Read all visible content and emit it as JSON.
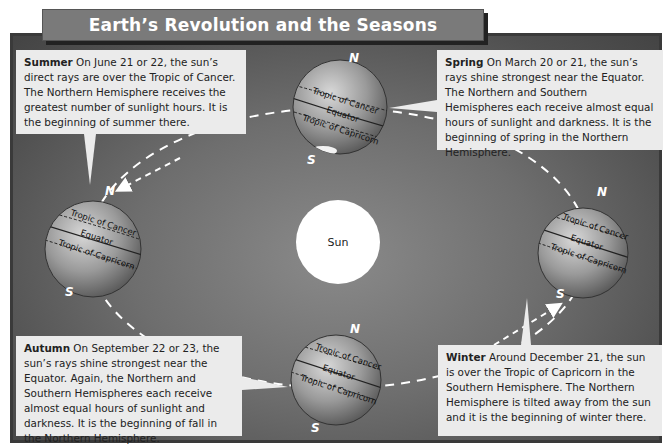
{
  "title": "Earth’s Revolution and the Seasons",
  "sun": {
    "label": "Sun"
  },
  "pole_labels": {
    "north": "N",
    "south": "S"
  },
  "latitude_labels": {
    "cancer": "Tropic of Cancer",
    "equator": "Equator",
    "capricorn": "Tropic of Capricorn"
  },
  "seasons": {
    "summer": {
      "name": "Summer",
      "text": "On June 21 or 22, the sun’s direct rays are over the Tropic of Cancer. The Northern Hemisphere receives the greatest number of sunlight hours. It is the beginning of summer there."
    },
    "spring": {
      "name": "Spring",
      "text": "On March 20 or 21, the sun’s rays shine strongest near the Equator. The Northern and Southern Hemispheres each receive almost equal hours of sunlight and darkness. It is the beginning of spring in the Northern Hemisphere."
    },
    "autumn": {
      "name": "Autumn",
      "text": "On September 22 or 23, the sun’s rays shine strongest near the Equator. Again, the Northern and Southern Hemispheres each receive almost equal hours of sunlight and darkness. It is the beginning of fall in the Northern Hemisphere."
    },
    "winter": {
      "name": "Winter",
      "text": "Around December 21, the sun is over the Tropic of Capricorn in the Southern Hemisphere. The Northern Hemisphere is tilted away from the sun and it is the beginning of winter there."
    }
  },
  "colors": {
    "background": "#6e6e6e",
    "frame": "#3a3a3a",
    "title_bar": "#7a7a7a",
    "callout": "#ebebeb",
    "sun": "#ffffff",
    "orbit": "#ffffff"
  }
}
